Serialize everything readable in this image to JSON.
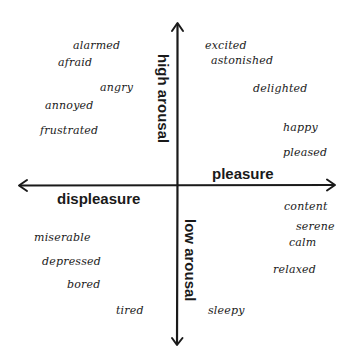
{
  "diagram": {
    "type": "circumplex-model-of-affect",
    "axes": {
      "top": "high arousal",
      "bottom": "low arousal",
      "right": "pleasure",
      "left": "displeasure"
    },
    "quadrants": {
      "top_left": [
        "alarmed",
        "afraid",
        "angry",
        "annoyed",
        "frustrated"
      ],
      "top_right": [
        "excited",
        "astonished",
        "delighted",
        "happy",
        "pleased"
      ],
      "bottom_left": [
        "miserable",
        "depressed",
        "bored",
        "tired"
      ],
      "bottom_right": [
        "content",
        "serene",
        "calm",
        "relaxed",
        "sleepy"
      ]
    },
    "words": [
      {
        "label": "alarmed",
        "x": 73,
        "y": 40
      },
      {
        "label": "afraid",
        "x": 58,
        "y": 57
      },
      {
        "label": "angry",
        "x": 100,
        "y": 82
      },
      {
        "label": "annoyed",
        "x": 45,
        "y": 100
      },
      {
        "label": "frustrated",
        "x": 40,
        "y": 125
      },
      {
        "label": "excited",
        "x": 205,
        "y": 40
      },
      {
        "label": "astonished",
        "x": 211,
        "y": 55
      },
      {
        "label": "delighted",
        "x": 253,
        "y": 83
      },
      {
        "label": "happy",
        "x": 283,
        "y": 122
      },
      {
        "label": "pleased",
        "x": 283,
        "y": 147
      },
      {
        "label": "content",
        "x": 284,
        "y": 201
      },
      {
        "label": "serene",
        "x": 296,
        "y": 221
      },
      {
        "label": "calm",
        "x": 289,
        "y": 237
      },
      {
        "label": "relaxed",
        "x": 273,
        "y": 264
      },
      {
        "label": "sleepy",
        "x": 208,
        "y": 305
      },
      {
        "label": "miserable",
        "x": 34,
        "y": 232
      },
      {
        "label": "depressed",
        "x": 42,
        "y": 256
      },
      {
        "label": "bored",
        "x": 67,
        "y": 279
      },
      {
        "label": "tired",
        "x": 116,
        "y": 305
      }
    ],
    "axis_labels": [
      {
        "key": "high_arousal",
        "label": "high arousal",
        "x": 171,
        "y": 54,
        "vertical": true
      },
      {
        "key": "low_arousal",
        "label": "low arousal",
        "x": 198,
        "y": 219,
        "vertical": true
      },
      {
        "key": "pleasure",
        "label": "pleasure",
        "x": 212,
        "y": 166,
        "vertical": false
      },
      {
        "key": "displeasure",
        "label": "displeasure",
        "x": 57,
        "y": 191,
        "vertical": false
      }
    ],
    "colors": {
      "ink": "#1a1a1a",
      "background": "#ffffff"
    }
  }
}
